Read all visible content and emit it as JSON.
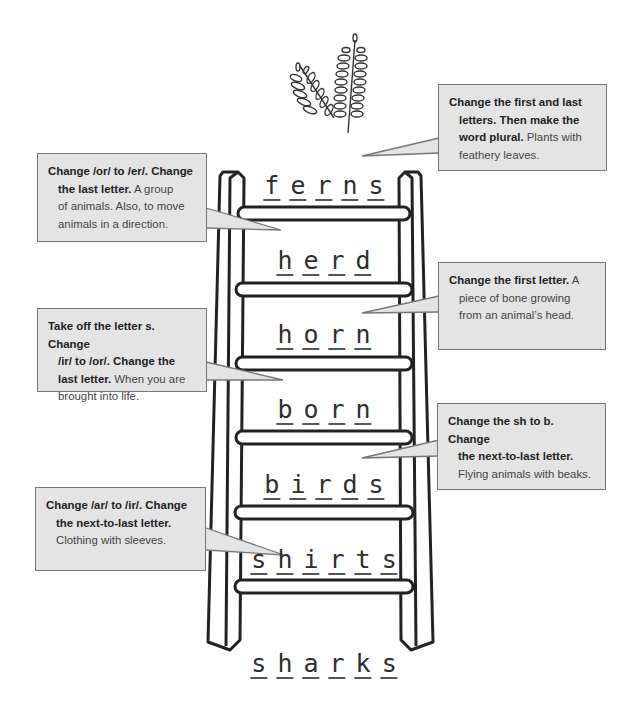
{
  "illustration": {
    "icon": "fern-leaves-icon"
  },
  "ladder": {
    "words": [
      {
        "word": "ferns",
        "letters": [
          "f",
          "e",
          "r",
          "n",
          "s"
        ]
      },
      {
        "word": "herd",
        "letters": [
          "h",
          "e",
          "r",
          "d"
        ]
      },
      {
        "word": "horn",
        "letters": [
          "h",
          "o",
          "r",
          "n"
        ]
      },
      {
        "word": "born",
        "letters": [
          "b",
          "o",
          "r",
          "n"
        ]
      },
      {
        "word": "birds",
        "letters": [
          "b",
          "i",
          "r",
          "d",
          "s"
        ]
      },
      {
        "word": "shirts",
        "letters": [
          "s",
          "h",
          "i",
          "r",
          "t",
          "s"
        ]
      }
    ],
    "start_word": {
      "word": "sharks",
      "letters": [
        "s",
        "h",
        "a",
        "r",
        "k",
        "s"
      ]
    }
  },
  "clues": [
    {
      "lines": [
        {
          "bold": "Change the first and last",
          "plain": ""
        },
        {
          "bold": "letters. Then make the",
          "plain": ""
        },
        {
          "bold": "word plural.",
          "plain": " Plants with"
        },
        {
          "bold": "",
          "plain": "feathery leaves."
        }
      ],
      "answer": "ferns"
    },
    {
      "lines": [
        {
          "bold": "Change /or/ to /er/. Change",
          "plain": ""
        },
        {
          "bold": "the last letter.",
          "plain": " A group"
        },
        {
          "bold": "",
          "plain": "of animals. Also, to move"
        },
        {
          "bold": "",
          "plain": "animals in a direction."
        }
      ],
      "answer": "herd"
    },
    {
      "lines": [
        {
          "bold": "Change the first letter.",
          "plain": " A"
        },
        {
          "bold": "",
          "plain": "piece of bone growing"
        },
        {
          "bold": "",
          "plain": "from an animal’s head."
        }
      ],
      "answer": "horn"
    },
    {
      "lines": [
        {
          "bold": "Take off the letter s. Change",
          "plain": ""
        },
        {
          "bold": "/ir/ to /or/. Change the",
          "plain": ""
        },
        {
          "bold": "last letter.",
          "plain": " When you are"
        },
        {
          "bold": "",
          "plain": "brought into life."
        }
      ],
      "answer": "born"
    },
    {
      "lines": [
        {
          "bold": "Change the sh to b. Change",
          "plain": ""
        },
        {
          "bold": "the next-to-last letter.",
          "plain": ""
        },
        {
          "bold": "",
          "plain": "Flying animals with beaks."
        }
      ],
      "answer": "birds"
    },
    {
      "lines": [
        {
          "bold": "Change /ar/ to /ir/. Change",
          "plain": ""
        },
        {
          "bold": "the next-to-last letter.",
          "plain": ""
        },
        {
          "bold": "",
          "plain": "Clothing with sleeves."
        }
      ],
      "answer": "shirts"
    }
  ]
}
